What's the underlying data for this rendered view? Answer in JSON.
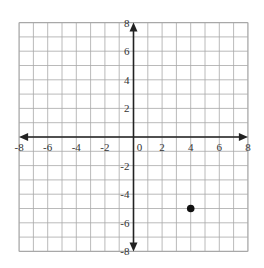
{
  "chart_data": {
    "type": "scatter",
    "title": "",
    "xlabel": "",
    "ylabel": "",
    "xlim": [
      -8,
      8
    ],
    "ylim": [
      -8,
      8
    ],
    "grid": true,
    "grid_step": 1,
    "x_ticks": [
      -8,
      -6,
      -4,
      -2,
      0,
      2,
      4,
      6,
      8
    ],
    "y_ticks": [
      8,
      6,
      4,
      2,
      -2,
      -4,
      -6,
      -8
    ],
    "x_tick_labels": [
      "-8",
      "-6",
      "-4",
      "-2",
      "0",
      "2",
      "4",
      "6",
      "8"
    ],
    "y_tick_labels": [
      "8",
      "6",
      "4",
      "2",
      "-2",
      "-4",
      "-6",
      "-8"
    ],
    "series": [
      {
        "name": "point",
        "points": [
          {
            "x": 4,
            "y": -5
          }
        ]
      }
    ],
    "legend": null
  },
  "colors": {
    "grid": "#a8a8a8",
    "axis": "#222222",
    "point": "#111111",
    "background": "#ffffff"
  }
}
